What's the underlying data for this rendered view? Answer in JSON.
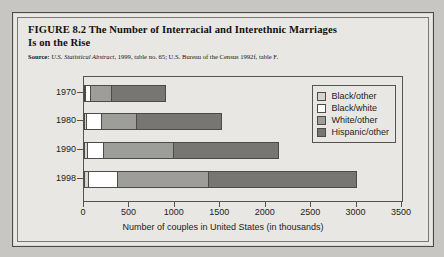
{
  "figure": {
    "label": "FIGURE 8.2",
    "title": "The Number of Interracial and Interethnic Marriages Is on the Rise",
    "title_line1": "FIGURE 8.2  The Number of Interracial and Interethnic Marriages",
    "title_line2": "Is on the Rise",
    "source_label": "Source:",
    "source_italic": "U.S. Statistical Abstract,",
    "source_rest": " 1999, table no. 65; U.S. Bureau of the Census 1992f, table F."
  },
  "colors": {
    "black_other": "#d6d4d0",
    "black_white": "#ffffff",
    "white_other": "#9d9d99",
    "hispanic_other": "#777672",
    "axis": "#55534f",
    "plate": "#e9e7e3",
    "page": "#c8c6c2"
  },
  "chart_data": {
    "type": "bar",
    "orientation": "horizontal",
    "stacked": true,
    "title": "The Number of Interracial and Interethnic Marriages Is on the Rise",
    "xlabel": "Number of couples in United States (in thousands)",
    "ylabel": "",
    "categories": [
      "1970",
      "1980",
      "1990",
      "1998"
    ],
    "xlim": [
      0,
      3500
    ],
    "xticks": [
      0,
      500,
      1000,
      1500,
      2000,
      2500,
      3000,
      3500
    ],
    "grid": false,
    "legend_position": "top-right",
    "series": [
      {
        "name": "Black/other",
        "color": "#d6d4d0",
        "values": [
          10,
          20,
          30,
          40
        ]
      },
      {
        "name": "Black/white",
        "color": "#ffffff",
        "values": [
          55,
          167,
          180,
          320
        ]
      },
      {
        "name": "White/other",
        "color": "#9d9d99",
        "values": [
          233,
          383,
          770,
          1000
        ]
      },
      {
        "name": "Hispanic/other",
        "color": "#777672",
        "values": [
          602,
          950,
          1170,
          1650
        ]
      }
    ],
    "totals": [
      900,
      1520,
      2150,
      3010
    ]
  }
}
